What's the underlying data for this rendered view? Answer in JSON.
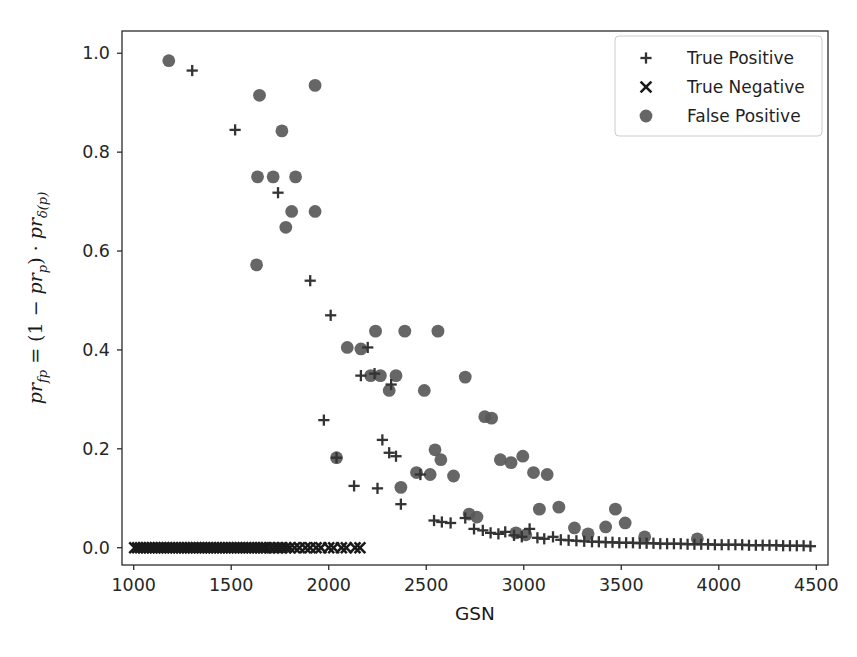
{
  "figure": {
    "background_color": "#ffffff",
    "marker_color": "#595959",
    "tp_marker_color": "#333333",
    "tn_marker_color": "#1a1a1a",
    "axis_color": "#2b2b2b",
    "plot_area": {
      "left": 122,
      "top": 31,
      "right": 828,
      "bottom": 565
    }
  },
  "chart_data": {
    "type": "scatter",
    "title": "",
    "xlabel": "GSN",
    "ylabel": "pr_fp = (1 - pr_p) * pr_d(p)",
    "ylabel_parts": {
      "v1": "pr",
      "v1sub": "fp",
      "eq": " = (1 − ",
      "v2": "pr",
      "v2sub": "p",
      "mid": ") · ",
      "v3": "pr",
      "v3sub": "δ(p)"
    },
    "xlim": [
      940,
      4560
    ],
    "ylim": [
      -0.035,
      1.045
    ],
    "xticks": [
      1000,
      1500,
      2000,
      2500,
      3000,
      3500,
      4000,
      4500
    ],
    "xtick_labels": [
      "1000",
      "1500",
      "2000",
      "2500",
      "3000",
      "3500",
      "4000",
      "4500"
    ],
    "yticks": [
      0.0,
      0.2,
      0.4,
      0.6,
      0.8,
      1.0
    ],
    "ytick_labels": [
      "0.0",
      "0.2",
      "0.4",
      "0.6",
      "0.8",
      "1.0"
    ],
    "grid": false,
    "legend_position": "upper right",
    "legend_entries": [
      {
        "label": "True Positive",
        "marker": "plus"
      },
      {
        "label": "True Negative",
        "marker": "cross"
      },
      {
        "label": "False Positive",
        "marker": "circle"
      }
    ],
    "series": [
      {
        "name": "True Positive",
        "marker": "plus",
        "color": "#333333",
        "points": [
          [
            1300,
            0.965
          ],
          [
            1520,
            0.845
          ],
          [
            1740,
            0.718
          ],
          [
            1905,
            0.54
          ],
          [
            2010,
            0.47
          ],
          [
            1975,
            0.258
          ],
          [
            2040,
            0.182
          ],
          [
            2200,
            0.405
          ],
          [
            2235,
            0.352
          ],
          [
            2165,
            0.348
          ],
          [
            2320,
            0.33
          ],
          [
            2275,
            0.218
          ],
          [
            2310,
            0.192
          ],
          [
            2345,
            0.185
          ],
          [
            2130,
            0.125
          ],
          [
            2250,
            0.12
          ],
          [
            2370,
            0.088
          ],
          [
            2470,
            0.148
          ],
          [
            2540,
            0.055
          ],
          [
            2580,
            0.052
          ],
          [
            2625,
            0.05
          ],
          [
            2700,
            0.06
          ],
          [
            2745,
            0.038
          ],
          [
            2790,
            0.035
          ],
          [
            2830,
            0.03
          ],
          [
            2870,
            0.028
          ],
          [
            2905,
            0.032
          ],
          [
            2950,
            0.025
          ],
          [
            2990,
            0.022
          ],
          [
            3030,
            0.038
          ],
          [
            3070,
            0.02
          ],
          [
            3105,
            0.018
          ],
          [
            3150,
            0.022
          ],
          [
            3190,
            0.016
          ],
          [
            3230,
            0.015
          ],
          [
            3270,
            0.014
          ],
          [
            3310,
            0.013
          ],
          [
            3350,
            0.012
          ],
          [
            3385,
            0.012
          ],
          [
            3420,
            0.011
          ],
          [
            3455,
            0.011
          ],
          [
            3490,
            0.01
          ],
          [
            3525,
            0.01
          ],
          [
            3560,
            0.01
          ],
          [
            3595,
            0.009
          ],
          [
            3630,
            0.009
          ],
          [
            3665,
            0.009
          ],
          [
            3700,
            0.008
          ],
          [
            3735,
            0.008
          ],
          [
            3770,
            0.008
          ],
          [
            3805,
            0.008
          ],
          [
            3840,
            0.007
          ],
          [
            3875,
            0.007
          ],
          [
            3910,
            0.007
          ],
          [
            3945,
            0.007
          ],
          [
            3980,
            0.006
          ],
          [
            4015,
            0.006
          ],
          [
            4050,
            0.006
          ],
          [
            4085,
            0.006
          ],
          [
            4120,
            0.006
          ],
          [
            4155,
            0.005
          ],
          [
            4190,
            0.005
          ],
          [
            4225,
            0.005
          ],
          [
            4260,
            0.005
          ],
          [
            4295,
            0.005
          ],
          [
            4330,
            0.004
          ],
          [
            4365,
            0.004
          ],
          [
            4400,
            0.004
          ],
          [
            4435,
            0.004
          ],
          [
            4470,
            0.003
          ]
        ]
      },
      {
        "name": "True Negative",
        "marker": "cross",
        "color": "#1a1a1a",
        "points": [
          [
            1005,
            0.0
          ],
          [
            1020,
            0.0
          ],
          [
            1035,
            0.0
          ],
          [
            1050,
            0.0
          ],
          [
            1065,
            0.0
          ],
          [
            1080,
            0.0
          ],
          [
            1095,
            0.0
          ],
          [
            1110,
            0.0
          ],
          [
            1125,
            0.0
          ],
          [
            1140,
            0.0
          ],
          [
            1155,
            0.0
          ],
          [
            1170,
            0.0
          ],
          [
            1185,
            0.0
          ],
          [
            1200,
            0.0
          ],
          [
            1215,
            0.0
          ],
          [
            1230,
            0.0
          ],
          [
            1245,
            0.0
          ],
          [
            1260,
            0.0
          ],
          [
            1275,
            0.0
          ],
          [
            1290,
            0.0
          ],
          [
            1305,
            0.0
          ],
          [
            1320,
            0.0
          ],
          [
            1335,
            0.0
          ],
          [
            1350,
            0.0
          ],
          [
            1365,
            0.0
          ],
          [
            1380,
            0.0
          ],
          [
            1395,
            0.0
          ],
          [
            1410,
            0.0
          ],
          [
            1425,
            0.0
          ],
          [
            1440,
            0.0
          ],
          [
            1455,
            0.0
          ],
          [
            1470,
            0.0
          ],
          [
            1485,
            0.0
          ],
          [
            1500,
            0.0
          ],
          [
            1515,
            0.0
          ],
          [
            1530,
            0.0
          ],
          [
            1545,
            0.0
          ],
          [
            1560,
            0.0
          ],
          [
            1575,
            0.0
          ],
          [
            1590,
            0.0
          ],
          [
            1605,
            0.0
          ],
          [
            1620,
            0.0
          ],
          [
            1635,
            0.0
          ],
          [
            1650,
            0.0
          ],
          [
            1665,
            0.0
          ],
          [
            1680,
            0.0
          ],
          [
            1700,
            0.0
          ],
          [
            1720,
            0.0
          ],
          [
            1740,
            0.0
          ],
          [
            1760,
            0.0
          ],
          [
            1780,
            0.0
          ],
          [
            1800,
            0.0
          ],
          [
            1825,
            0.0
          ],
          [
            1850,
            0.0
          ],
          [
            1880,
            0.0
          ],
          [
            1905,
            0.0
          ],
          [
            1935,
            0.0
          ],
          [
            1960,
            0.0
          ],
          [
            2000,
            0.0
          ],
          [
            2025,
            0.0
          ],
          [
            2065,
            0.0
          ],
          [
            2090,
            0.0
          ],
          [
            2135,
            0.0
          ],
          [
            2160,
            0.0
          ]
        ]
      },
      {
        "name": "False Positive",
        "marker": "circle",
        "color": "#595959",
        "points": [
          [
            1180,
            0.985
          ],
          [
            1645,
            0.915
          ],
          [
            1930,
            0.935
          ],
          [
            1760,
            0.843
          ],
          [
            1635,
            0.75
          ],
          [
            1715,
            0.75
          ],
          [
            1830,
            0.75
          ],
          [
            1810,
            0.68
          ],
          [
            1930,
            0.68
          ],
          [
            1780,
            0.648
          ],
          [
            1630,
            0.572
          ],
          [
            2095,
            0.405
          ],
          [
            2240,
            0.438
          ],
          [
            2390,
            0.438
          ],
          [
            2560,
            0.438
          ],
          [
            2165,
            0.402
          ],
          [
            2215,
            0.348
          ],
          [
            2265,
            0.348
          ],
          [
            2345,
            0.348
          ],
          [
            2310,
            0.318
          ],
          [
            2490,
            0.318
          ],
          [
            2700,
            0.345
          ],
          [
            2040,
            0.182
          ],
          [
            2370,
            0.122
          ],
          [
            2450,
            0.152
          ],
          [
            2520,
            0.148
          ],
          [
            2545,
            0.198
          ],
          [
            2575,
            0.178
          ],
          [
            2640,
            0.145
          ],
          [
            2800,
            0.265
          ],
          [
            2835,
            0.262
          ],
          [
            2880,
            0.178
          ],
          [
            2935,
            0.172
          ],
          [
            2995,
            0.185
          ],
          [
            3050,
            0.152
          ],
          [
            3120,
            0.148
          ],
          [
            3080,
            0.078
          ],
          [
            3180,
            0.082
          ],
          [
            2720,
            0.068
          ],
          [
            2760,
            0.062
          ],
          [
            3260,
            0.04
          ],
          [
            3330,
            0.028
          ],
          [
            3420,
            0.042
          ],
          [
            3470,
            0.078
          ],
          [
            3520,
            0.05
          ],
          [
            3620,
            0.022
          ],
          [
            3890,
            0.018
          ],
          [
            2960,
            0.03
          ],
          [
            3010,
            0.026
          ]
        ]
      }
    ]
  }
}
